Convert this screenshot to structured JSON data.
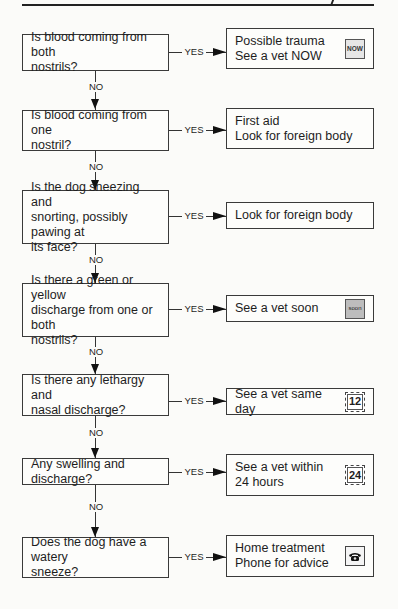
{
  "flowchart": {
    "connector_labels": {
      "no": "NO",
      "yes": "YES"
    },
    "steps": [
      {
        "question": "Is blood coming from both\nnostrils?",
        "answer": "Possible trauma\nSee a vet NOW",
        "icon": "now-icon",
        "icon_text": "NOW"
      },
      {
        "question": "Is blood coming from one\nnostril?",
        "answer": "First aid\nLook for foreign body",
        "icon": null,
        "icon_text": ""
      },
      {
        "question": "Is the dog sneezing and\nsnorting, possibly pawing at\nits face?",
        "answer": "Look for foreign body",
        "icon": null,
        "icon_text": ""
      },
      {
        "question": "Is there a green or yellow\ndischarge from one or both\nnostrils?",
        "answer": "See a vet soon",
        "icon": "soon-icon",
        "icon_text": "soon"
      },
      {
        "question": "Is there any lethargy and\nnasal discharge?",
        "answer": "See a vet same day",
        "icon": "clock-12-icon",
        "icon_text": "12"
      },
      {
        "question": "Any swelling and discharge?",
        "answer": "See a vet within\n24 hours",
        "icon": "clock-24-icon",
        "icon_text": "24"
      },
      {
        "question": "Does the dog have a watery\nsneeze?",
        "answer": "Home treatment\nPhone for advice",
        "icon": "phone-icon",
        "icon_text": ""
      }
    ]
  }
}
